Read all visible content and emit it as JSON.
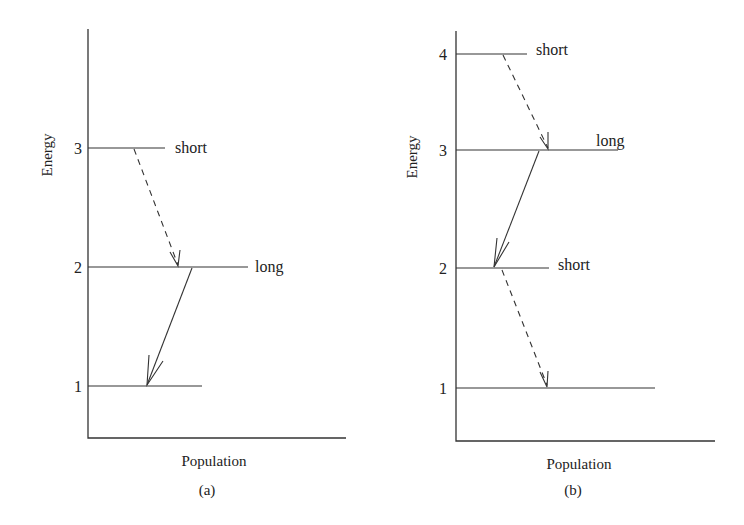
{
  "figure": {
    "panels": [
      {
        "id": "a",
        "caption": "(a)",
        "xlabel": "Population",
        "ylabel": "Energy",
        "levels": [
          {
            "number": "3",
            "lifetime": "short"
          },
          {
            "number": "2",
            "lifetime": "long"
          },
          {
            "number": "1",
            "lifetime": ""
          }
        ],
        "transitions": [
          {
            "from": "3",
            "to": "2",
            "style": "dashed"
          },
          {
            "from": "2",
            "to": "1",
            "style": "solid"
          }
        ]
      },
      {
        "id": "b",
        "caption": "(b)",
        "xlabel": "Population",
        "ylabel": "Energy",
        "levels": [
          {
            "number": "4",
            "lifetime": "short"
          },
          {
            "number": "3",
            "lifetime": "long"
          },
          {
            "number": "2",
            "lifetime": "short"
          },
          {
            "number": "1",
            "lifetime": ""
          }
        ],
        "transitions": [
          {
            "from": "4",
            "to": "3",
            "style": "dashed"
          },
          {
            "from": "3",
            "to": "2",
            "style": "solid"
          },
          {
            "from": "2",
            "to": "1",
            "style": "dashed"
          }
        ]
      }
    ]
  }
}
